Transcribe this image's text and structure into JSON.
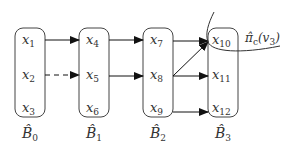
{
  "diagram": {
    "type": "layered-graph",
    "blocks": [
      {
        "id": "B0",
        "label": "B̂",
        "sub": "0",
        "nodes": [
          {
            "name": "x",
            "sub": "1"
          },
          {
            "name": "x",
            "sub": "2"
          },
          {
            "name": "x",
            "sub": "3"
          }
        ]
      },
      {
        "id": "B1",
        "label": "B̂",
        "sub": "1",
        "nodes": [
          {
            "name": "x",
            "sub": "4"
          },
          {
            "name": "x",
            "sub": "5"
          },
          {
            "name": "x",
            "sub": "6"
          }
        ]
      },
      {
        "id": "B2",
        "label": "B̂",
        "sub": "2",
        "nodes": [
          {
            "name": "x",
            "sub": "7"
          },
          {
            "name": "x",
            "sub": "8"
          },
          {
            "name": "x",
            "sub": "9"
          }
        ]
      },
      {
        "id": "B3",
        "label": "B̂",
        "sub": "3",
        "nodes": [
          {
            "name": "x",
            "sub": "10"
          },
          {
            "name": "x",
            "sub": "11"
          },
          {
            "name": "x",
            "sub": "12"
          }
        ]
      }
    ],
    "edges": [
      {
        "from": "x1",
        "to": "x4",
        "style": "solid"
      },
      {
        "from": "x2",
        "to": "x5",
        "style": "dashed"
      },
      {
        "from": "x4",
        "to": "x7",
        "style": "solid"
      },
      {
        "from": "x5",
        "to": "x8",
        "style": "solid"
      },
      {
        "from": "x7",
        "to": "x10",
        "style": "solid"
      },
      {
        "from": "x8",
        "to": "x10",
        "style": "solid"
      },
      {
        "from": "x8",
        "to": "x11",
        "style": "solid"
      },
      {
        "from": "x9",
        "to": "x12",
        "style": "solid"
      }
    ],
    "annotation": {
      "text": "π̂",
      "sub": "c",
      "arg": "(v",
      "arg_sub": "3",
      "close": ")"
    }
  }
}
